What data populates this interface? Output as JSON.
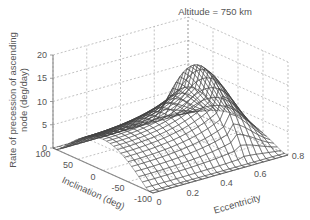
{
  "chart_data": {
    "type": "surface3d",
    "title": "Altitude = 750 km",
    "xlabel": "Eccentricity",
    "ylabel": "Inclination (deg)",
    "zlabel": "Rate of precession of ascending node (deg/day)",
    "x_ticks": [
      "0",
      "0.2",
      "0.4",
      "0.6",
      "0.8"
    ],
    "x_range": [
      0,
      0.8
    ],
    "y_ticks": [
      "100",
      "50",
      "0",
      "-50",
      "-100"
    ],
    "y_range": [
      -100,
      100
    ],
    "z_ticks": [
      "0",
      "5",
      "10",
      "15",
      "20"
    ],
    "z_range": [
      0,
      20
    ],
    "grid": true,
    "surface": {
      "description": "Mesh surface; value ~0 at inclination ±90..100 deg, rising with eccentricity, peak ≈17 deg/day near inclination 0, eccentricity ≈0.55",
      "peak": {
        "inclination": 0,
        "eccentricity": 0.55,
        "value": 17
      },
      "e0_i0_value": 6.7,
      "ecc_samples": [
        0,
        0.1,
        0.2,
        0.3,
        0.4,
        0.5,
        0.55
      ],
      "values_at_inclination_0": [
        6.7,
        7.0,
        7.8,
        9.3,
        11.8,
        15.5,
        17
      ]
    }
  },
  "labels": {
    "title": "Altitude = 750 km",
    "zlabel_line1": "Rate of precession of ascending",
    "zlabel_line2": "node (deg/day)",
    "ylabel": "Inclination (deg)",
    "xlabel": "Eccentricity"
  },
  "colors": {
    "text": "#555555",
    "axis": "#888888",
    "grid": "#999999",
    "mesh": "#444444",
    "surface_fill": "#ffffff"
  }
}
